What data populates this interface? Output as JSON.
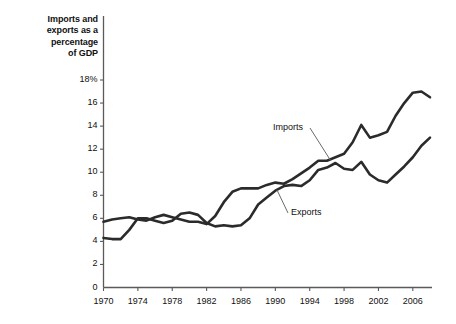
{
  "chart_data": {
    "type": "line",
    "title": "Imports and exports as a percentage of GDP",
    "xlabel": "",
    "ylabel": "Imports and exports as a percentage of GDP",
    "xlim": [
      1970,
      2008
    ],
    "ylim": [
      0,
      18
    ],
    "grid": false,
    "legend_position": "inline-annotation",
    "x_tick_labels": [
      "1970",
      "1974",
      "1978",
      "1982",
      "1986",
      "1990",
      "1994",
      "1998",
      "2002",
      "2006"
    ],
    "x_ticks": [
      1970,
      1974,
      1978,
      1982,
      1986,
      1990,
      1994,
      1998,
      2002,
      2006
    ],
    "y_tick_labels": [
      "0",
      "2",
      "4",
      "6",
      "8",
      "10",
      "12",
      "14",
      "16",
      "18%"
    ],
    "y_ticks": [
      0,
      2,
      4,
      6,
      8,
      10,
      12,
      14,
      16,
      18
    ],
    "x": [
      1970,
      1971,
      1972,
      1973,
      1974,
      1975,
      1976,
      1977,
      1978,
      1979,
      1980,
      1981,
      1982,
      1983,
      1984,
      1985,
      1986,
      1987,
      1988,
      1989,
      1990,
      1991,
      1992,
      1993,
      1994,
      1995,
      1996,
      1997,
      1998,
      1999,
      2000,
      2001,
      2002,
      2003,
      2004,
      2005,
      2006,
      2007,
      2008
    ],
    "series": [
      {
        "name": "Imports",
        "color": "#2b2b2b",
        "values": [
          5.7,
          5.9,
          6.0,
          6.1,
          5.9,
          5.8,
          6.1,
          6.3,
          6.1,
          5.9,
          5.7,
          5.7,
          5.5,
          6.2,
          7.4,
          8.3,
          8.6,
          8.6,
          8.6,
          8.9,
          9.1,
          9.0,
          9.4,
          9.9,
          10.4,
          11.0,
          11.0,
          11.3,
          11.6,
          12.6,
          14.1,
          13.0,
          13.2,
          13.5,
          14.9,
          16.0,
          16.9,
          17.0,
          16.5
        ]
      },
      {
        "name": "Exports",
        "color": "#2b2b2b",
        "values": [
          4.3,
          4.2,
          4.2,
          5.0,
          6.0,
          6.0,
          5.8,
          5.6,
          5.8,
          6.4,
          6.5,
          6.3,
          5.6,
          5.3,
          5.4,
          5.3,
          5.4,
          6.0,
          7.2,
          7.8,
          8.4,
          8.8,
          8.9,
          8.8,
          9.3,
          10.2,
          10.4,
          10.8,
          10.3,
          10.2,
          10.9,
          9.8,
          9.3,
          9.1,
          9.8,
          10.5,
          11.3,
          12.3,
          13.0
        ]
      }
    ],
    "annotations": [
      {
        "text": "Imports",
        "series": "Imports"
      },
      {
        "text": "Exports",
        "series": "Exports"
      }
    ]
  },
  "axis": {
    "title": "Imports and\nexports as a\npercentage\nof GDP"
  }
}
